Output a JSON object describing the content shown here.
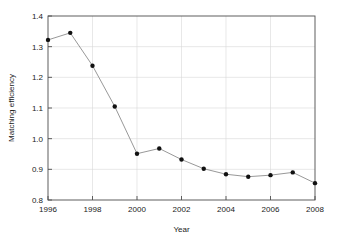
{
  "chart_data": {
    "type": "line",
    "title": "",
    "xlabel": "Year",
    "ylabel": "Matching efficiency",
    "x": [
      1996,
      1997,
      1998,
      1999,
      2000,
      2001,
      2002,
      2003,
      2004,
      2005,
      2006,
      2007,
      2008
    ],
    "values": [
      1.322,
      1.345,
      1.238,
      1.105,
      0.951,
      0.968,
      0.932,
      0.902,
      0.884,
      0.876,
      0.881,
      0.89,
      0.855
    ],
    "series": [
      {
        "name": "Matching efficiency",
        "values": [
          1.322,
          1.345,
          1.238,
          1.105,
          0.951,
          0.968,
          0.932,
          0.902,
          0.884,
          0.876,
          0.881,
          0.89,
          0.855
        ]
      }
    ],
    "xlim": [
      1996,
      2008
    ],
    "ylim": [
      0.8,
      1.4
    ],
    "xticks": [
      1996,
      1998,
      2000,
      2002,
      2004,
      2006,
      2008
    ],
    "xticklabels": [
      "1996",
      "1998",
      "2000",
      "2002",
      "2004",
      "2006",
      "2008"
    ],
    "yticks": [
      0.8,
      0.9,
      1.0,
      1.1,
      1.2,
      1.3,
      1.4
    ],
    "yticklabels": [
      "0.8",
      "0.9",
      "1.0",
      "1.1",
      "1.2",
      "1.3",
      "1.4"
    ],
    "grid": "horizontal",
    "legend": "none",
    "marker": "filled-circle",
    "marker_color": "#111111",
    "line_color": "#8c8c8c",
    "grid_color": "#d9d9d9",
    "frame_color": "#4d4d4d",
    "background": "#ffffff"
  }
}
